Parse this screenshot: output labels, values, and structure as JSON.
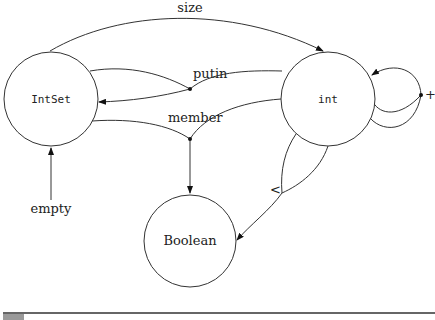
{
  "diagram": {
    "nodes": [
      {
        "id": "intset",
        "label": "IntSet",
        "font": "mono"
      },
      {
        "id": "int",
        "label": "int",
        "font": "mono"
      },
      {
        "id": "boolean",
        "label": "Boolean",
        "font": "serif"
      }
    ],
    "operations": {
      "size": {
        "label": "size",
        "from": [
          "IntSet"
        ],
        "to": "int"
      },
      "putin": {
        "label": "putin",
        "from": [
          "IntSet",
          "int"
        ],
        "to": "IntSet"
      },
      "member": {
        "label": "member",
        "from": [
          "IntSet",
          "int"
        ],
        "to": "Boolean"
      },
      "empty": {
        "label": "empty",
        "from": [],
        "to": "IntSet"
      },
      "less": {
        "label": "<",
        "from": [
          "int",
          "int"
        ],
        "to": "Boolean"
      },
      "plus": {
        "label": "+",
        "from": [
          "int",
          "int"
        ],
        "to": "int"
      }
    }
  },
  "colors": {
    "stroke": "#333333",
    "background": "#ffffff",
    "footer_box": "#9a9a9a"
  }
}
